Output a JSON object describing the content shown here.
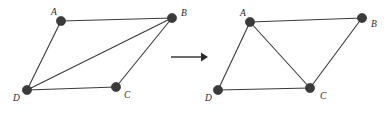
{
  "figure": {
    "width": 392,
    "height": 113,
    "background": "#ffffff",
    "node_color": "#3b3b3b",
    "edge_color": "#3a3a3a",
    "label_color": "#2b2b2b",
    "arrow_color": "#2b2b2b"
  },
  "diagram_left": {
    "name": "before-graph",
    "vertices": [
      {
        "id": "A",
        "label": "A",
        "x": 61,
        "y": 21,
        "label_x": 51,
        "label_y": 15
      },
      {
        "id": "B",
        "label": "B",
        "x": 172,
        "y": 18,
        "label_x": 181,
        "label_y": 16
      },
      {
        "id": "C",
        "label": "C",
        "x": 116,
        "y": 87,
        "label_x": 124,
        "label_y": 98
      },
      {
        "id": "D",
        "label": "D",
        "x": 27,
        "y": 90,
        "label_x": 13,
        "label_y": 101
      }
    ],
    "edges": [
      {
        "from": "A",
        "to": "B"
      },
      {
        "from": "A",
        "to": "D"
      },
      {
        "from": "D",
        "to": "B"
      },
      {
        "from": "D",
        "to": "C"
      },
      {
        "from": "C",
        "to": "B"
      }
    ],
    "diagonal": "D-B"
  },
  "diagram_right": {
    "name": "after-graph",
    "vertices": [
      {
        "id": "A",
        "label": "A",
        "x": 250,
        "y": 22,
        "label_x": 240,
        "label_y": 16
      },
      {
        "id": "B",
        "label": "B",
        "x": 362,
        "y": 18,
        "label_x": 371,
        "label_y": 27
      },
      {
        "id": "C",
        "label": "C",
        "x": 310,
        "y": 88,
        "label_x": 320,
        "label_y": 99
      },
      {
        "id": "D",
        "label": "D",
        "x": 218,
        "y": 90,
        "label_x": 205,
        "label_y": 101
      }
    ],
    "edges": [
      {
        "from": "A",
        "to": "B"
      },
      {
        "from": "A",
        "to": "D"
      },
      {
        "from": "A",
        "to": "C"
      },
      {
        "from": "D",
        "to": "C"
      },
      {
        "from": "C",
        "to": "B"
      }
    ],
    "diagonal": "A-C"
  },
  "arrow": {
    "name": "transformation-arrow",
    "x1": 171,
    "y1": 57,
    "x2": 201,
    "y2": 57,
    "head_points": "201,52.5 208,57 201,61.5"
  },
  "node_radius": 4.6
}
